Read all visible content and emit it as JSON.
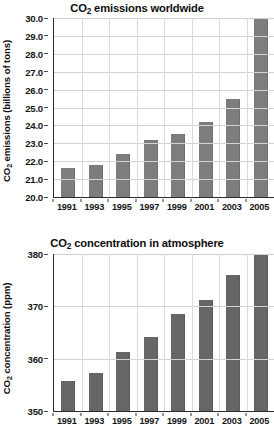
{
  "chart_data": [
    {
      "type": "bar",
      "id": "co2-emissions-worldwide",
      "title": "CO2 emissions worldwide",
      "title_parts": {
        "prefix": "CO",
        "sub": "2",
        "suffix": " emissions worldwide"
      },
      "xlabel": "",
      "ylabel": "CO2 emissions (billions of tons)",
      "ylabel_parts": {
        "prefix": "CO",
        "sub": "2",
        "suffix": " emissions (billions of tons)"
      },
      "categories": [
        "1991",
        "1993",
        "1995",
        "1997",
        "1999",
        "2001",
        "2003",
        "2005"
      ],
      "values": [
        21.6,
        21.8,
        22.4,
        23.2,
        23.5,
        24.2,
        25.5,
        30.0
      ],
      "ylim": [
        20.0,
        30.0
      ],
      "ytick_labels": [
        "30.0",
        "29.0",
        "28.0",
        "27.0",
        "26.0",
        "25.0",
        "24.0",
        "23.0",
        "22.0",
        "21.0",
        "20.0"
      ],
      "ytick_values": [
        30.0,
        29.0,
        28.0,
        27.0,
        26.0,
        25.0,
        24.0,
        23.0,
        22.0,
        21.0,
        20.0
      ],
      "grid": true,
      "legend": "none",
      "bar_color": "#7d7d7d",
      "axis_color": "#2b2b2b",
      "grid_color": "#d2d2d2"
    },
    {
      "type": "bar",
      "id": "co2-concentration-in-atmosphere",
      "title": "CO2 concentration in atmosphere",
      "title_parts": {
        "prefix": "CO",
        "sub": "2",
        "suffix": " concentration in atmosphere"
      },
      "xlabel": "",
      "ylabel": "CO2 concentration (ppm)",
      "ylabel_parts": {
        "prefix": "CO",
        "sub": "2",
        "suffix": " concentration (ppm)"
      },
      "categories": [
        "1991",
        "1993",
        "1995",
        "1997",
        "1999",
        "2001",
        "2003",
        "2005"
      ],
      "values": [
        355.7,
        357.2,
        361.2,
        364.1,
        368.6,
        371.3,
        375.9,
        380.0
      ],
      "ylim": [
        350,
        380
      ],
      "ytick_labels": [
        "380",
        "370",
        "360",
        "350"
      ],
      "ytick_values": [
        380,
        370,
        360,
        350
      ],
      "grid": true,
      "legend": "none",
      "bar_color": "#666666",
      "axis_color": "#2b2b2b",
      "grid_color": "#d2d2d2"
    }
  ],
  "page": {
    "background": "#ffffff",
    "cutoff_text": ""
  }
}
